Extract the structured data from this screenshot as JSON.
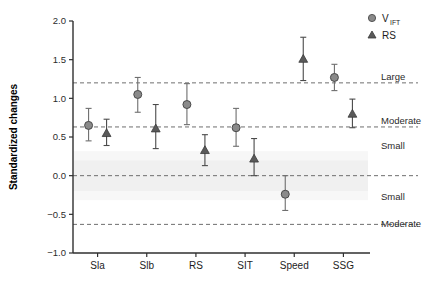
{
  "chart_data": {
    "type": "scatter",
    "title": "",
    "xlabel": "",
    "ylabel": "Standardized changes",
    "ylim": [
      -1.0,
      2.0
    ],
    "ytick_labels": [
      "2.0",
      "1.5",
      "1.0",
      "0.5",
      "0.0",
      "-0.5",
      "-1.0"
    ],
    "ytick_values": [
      2.0,
      1.5,
      1.0,
      0.5,
      0.0,
      -0.5,
      -1.0
    ],
    "categories": [
      "Sla",
      "Slb",
      "RS",
      "SIT",
      "Speed",
      "SSG"
    ],
    "grid": false,
    "legend_position": "top-right",
    "series": [
      {
        "name": "V_IFT",
        "marker": "circle",
        "color": "#6e6e6e",
        "values": [
          0.65,
          1.05,
          0.92,
          0.62,
          -0.24,
          1.27
        ],
        "ci_low": [
          0.45,
          0.82,
          0.66,
          0.38,
          -0.45,
          1.1
        ],
        "ci_high": [
          0.87,
          1.27,
          1.19,
          0.87,
          0.0,
          1.44
        ]
      },
      {
        "name": "RS",
        "marker": "triangle",
        "color": "#4a4a4a",
        "values": [
          0.55,
          0.61,
          0.33,
          0.22,
          1.51,
          0.8
        ],
        "ci_low": [
          0.39,
          0.35,
          0.13,
          0.0,
          1.23,
          0.62
        ],
        "ci_high": [
          0.73,
          0.92,
          0.53,
          0.48,
          1.79,
          0.99
        ]
      }
    ],
    "threshold_lines": [
      {
        "value": 1.2,
        "label": "Large"
      },
      {
        "value": 0.63,
        "label": "Moderate"
      },
      {
        "value": 0.0,
        "label": "Small"
      },
      {
        "value": -0.63,
        "label": "Moderate"
      }
    ],
    "zone_labels": [
      {
        "value": 1.2,
        "label": "Large"
      },
      {
        "value": 0.63,
        "label": "Moderate"
      },
      {
        "value": 0.3,
        "label": "Small"
      },
      {
        "value": -0.35,
        "label": "Small"
      },
      {
        "value": -0.7,
        "label": "Moderate"
      }
    ],
    "trivial_band": {
      "low": -0.2,
      "high": 0.2,
      "color": "#ededed"
    }
  },
  "legend": {
    "entries": [
      {
        "main": "V",
        "sub": "IFT",
        "marker": "circle"
      },
      {
        "main": "RS",
        "sub": "",
        "marker": "triangle"
      }
    ]
  }
}
